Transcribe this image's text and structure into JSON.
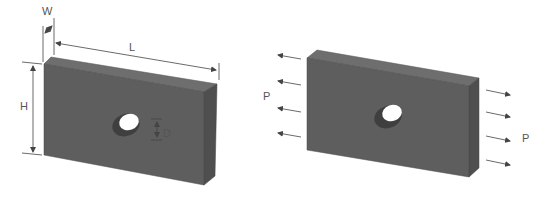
{
  "figure": {
    "left_panel": {
      "description": "Rectangular plate with central circular hole, dimensioned",
      "labels": {
        "width": "W",
        "length": "L",
        "height": "H",
        "diameter": "D"
      }
    },
    "right_panel": {
      "description": "Same plate loaded in uniaxial tension",
      "labels": {
        "load_left": "P",
        "load_right": "P"
      },
      "arrows_per_side": 4
    },
    "colors": {
      "plate_front": "#5e5e5e",
      "plate_top": "#6e6e6e",
      "plate_side": "#4f4f4f",
      "dimension_line": "#444444",
      "hole": "#ffffff"
    }
  }
}
